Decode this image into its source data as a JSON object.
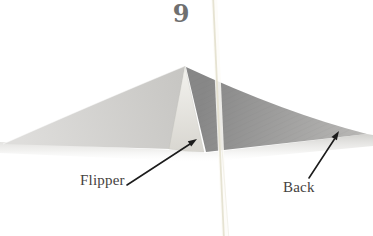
{
  "page": {
    "step_number": "9",
    "labels": {
      "flipper": "Flipper",
      "back": "Back"
    },
    "icons": {
      "flipper_arrow": "pointer-arrow",
      "back_arrow": "pointer-arrow"
    },
    "colors": {
      "background": "#ffffff",
      "left_face_light": "#dedddb",
      "left_face_dark": "#c7c6c3",
      "flipper_light": "#f2f1ed",
      "flipper_dark": "#d8d6d0",
      "back_face_dark": "#878787",
      "back_face_light": "#bab9b7",
      "shadow": "#c5c4c0",
      "page_crease": "#e3dfcc",
      "arrow": "#1c1c1c",
      "label_text": "#45423e",
      "step_number": "#6f6f6f"
    }
  }
}
